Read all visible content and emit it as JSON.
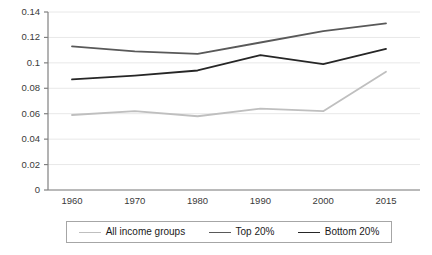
{
  "chart_data": {
    "type": "line",
    "title": "",
    "subtitle": "",
    "xlabel": "",
    "ylabel": "",
    "categories": [
      "1960",
      "1970",
      "1980",
      "1990",
      "2000",
      "2015"
    ],
    "ylim": [
      0,
      0.14
    ],
    "yticks": [
      "0",
      "0.02",
      "0.04",
      "0.06",
      "0.08",
      "0.1",
      "0.12",
      "0.14"
    ],
    "ytick_values": [
      0,
      0.02,
      0.04,
      0.06,
      0.08,
      0.1,
      0.12,
      0.14
    ],
    "grid": "horizontal",
    "legend_position": "bottom",
    "series": [
      {
        "name": "All income groups",
        "color": "#bfbfbf",
        "values": [
          0.059,
          0.062,
          0.058,
          0.064,
          0.062,
          0.093
        ]
      },
      {
        "name": "Top 20%",
        "color": "#595959",
        "values": [
          0.113,
          0.109,
          0.107,
          0.116,
          0.125,
          0.131
        ]
      },
      {
        "name": "Bottom 20%",
        "color": "#262626",
        "values": [
          0.087,
          0.09,
          0.094,
          0.106,
          0.099,
          0.111
        ]
      }
    ]
  },
  "axis": {
    "line_color": "#808080",
    "grid_color": "#e8e8e8"
  }
}
